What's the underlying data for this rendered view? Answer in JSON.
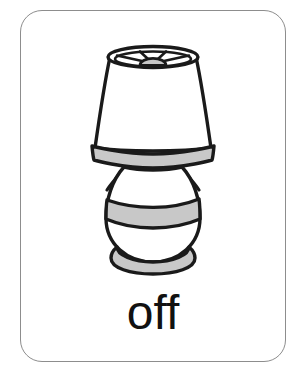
{
  "card": {
    "name": "vocabulary-flashcard",
    "word": "off",
    "border_color": "#8d8d8d",
    "background_color": "#ffffff"
  },
  "illustration": {
    "subject": "table-lamp",
    "style": "black-outline-line-art",
    "outline_color": "#1a1a1a",
    "shade_fill": "#ffffff",
    "accent_fill": "#c8c8c8",
    "parts": [
      {
        "name": "lamp-shade-top-ellipse",
        "fill": "#ffffff",
        "stroke": "#1a1a1a"
      },
      {
        "name": "lamp-shade-spokes",
        "count": 4,
        "stroke": "#1a1a1a"
      },
      {
        "name": "lamp-bulb-dome",
        "fill": "#c8c8c8",
        "stroke": "#1a1a1a"
      },
      {
        "name": "lamp-shade-body",
        "fill": "#ffffff",
        "stroke": "#1a1a1a"
      },
      {
        "name": "lamp-shade-bottom-band",
        "fill": "#c8c8c8",
        "stroke": "#1a1a1a"
      },
      {
        "name": "lamp-neck",
        "stroke": "#1a1a1a"
      },
      {
        "name": "lamp-body-sphere",
        "fill": "#ffffff",
        "stroke": "#1a1a1a"
      },
      {
        "name": "lamp-body-middle-band",
        "fill": "#c8c8c8",
        "stroke": "#1a1a1a"
      },
      {
        "name": "lamp-base-ring",
        "fill": "#c8c8c8",
        "stroke": "#1a1a1a"
      }
    ]
  }
}
